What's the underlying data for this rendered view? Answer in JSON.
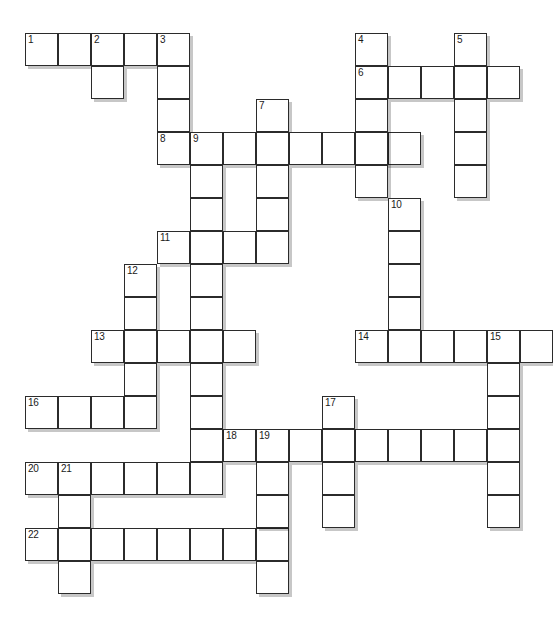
{
  "puzzle": {
    "type": "crossword-grid",
    "title": "Crossword Puzzle Grid",
    "geometry": {
      "origin_x": 25,
      "origin_y": 33,
      "cell_size": 33,
      "columns": 16,
      "rows": 17,
      "cell_border_color": "#2b2b2b",
      "cell_fill_color": "#ffffff",
      "shadow_color": "rgba(0,0,0,0.22)",
      "number_color": "#1a1a1a",
      "page_background": "#ffffff"
    },
    "numbered_clue_labels": [
      "1",
      "2",
      "3",
      "4",
      "5",
      "6",
      "7",
      "8",
      "9",
      "10",
      "11",
      "12",
      "13",
      "14",
      "15",
      "16",
      "17",
      "18",
      "19",
      "20",
      "21",
      "22"
    ],
    "cells": [
      {
        "c": 0,
        "r": 0,
        "n": "1"
      },
      {
        "c": 1,
        "r": 0,
        "n": ""
      },
      {
        "c": 2,
        "r": 0,
        "n": "2"
      },
      {
        "c": 3,
        "r": 0,
        "n": ""
      },
      {
        "c": 4,
        "r": 0,
        "n": "3"
      },
      {
        "c": 2,
        "r": 1,
        "n": ""
      },
      {
        "c": 4,
        "r": 1,
        "n": ""
      },
      {
        "c": 4,
        "r": 2,
        "n": ""
      },
      {
        "c": 7,
        "r": 2,
        "n": "7"
      },
      {
        "c": 4,
        "r": 3,
        "n": "8"
      },
      {
        "c": 5,
        "r": 3,
        "n": "9"
      },
      {
        "c": 6,
        "r": 3,
        "n": ""
      },
      {
        "c": 7,
        "r": 3,
        "n": ""
      },
      {
        "c": 8,
        "r": 3,
        "n": ""
      },
      {
        "c": 9,
        "r": 3,
        "n": ""
      },
      {
        "c": 10,
        "r": 3,
        "n": ""
      },
      {
        "c": 11,
        "r": 3,
        "n": ""
      },
      {
        "c": 5,
        "r": 4,
        "n": ""
      },
      {
        "c": 7,
        "r": 4,
        "n": ""
      },
      {
        "c": 5,
        "r": 5,
        "n": ""
      },
      {
        "c": 7,
        "r": 5,
        "n": ""
      },
      {
        "c": 4,
        "r": 6,
        "n": "11"
      },
      {
        "c": 5,
        "r": 6,
        "n": ""
      },
      {
        "c": 6,
        "r": 6,
        "n": ""
      },
      {
        "c": 7,
        "r": 6,
        "n": ""
      },
      {
        "c": 3,
        "r": 7,
        "n": "12"
      },
      {
        "c": 5,
        "r": 7,
        "n": ""
      },
      {
        "c": 3,
        "r": 8,
        "n": ""
      },
      {
        "c": 5,
        "r": 8,
        "n": ""
      },
      {
        "c": 2,
        "r": 9,
        "n": "13"
      },
      {
        "c": 3,
        "r": 9,
        "n": ""
      },
      {
        "c": 4,
        "r": 9,
        "n": ""
      },
      {
        "c": 5,
        "r": 9,
        "n": ""
      },
      {
        "c": 6,
        "r": 9,
        "n": ""
      },
      {
        "c": 3,
        "r": 10,
        "n": ""
      },
      {
        "c": 5,
        "r": 10,
        "n": ""
      },
      {
        "c": 0,
        "r": 11,
        "n": "16"
      },
      {
        "c": 1,
        "r": 11,
        "n": ""
      },
      {
        "c": 2,
        "r": 11,
        "n": ""
      },
      {
        "c": 3,
        "r": 11,
        "n": ""
      },
      {
        "c": 5,
        "r": 11,
        "n": ""
      },
      {
        "c": 5,
        "r": 12,
        "n": ""
      },
      {
        "c": 0,
        "r": 13,
        "n": "20"
      },
      {
        "c": 1,
        "r": 13,
        "n": "21"
      },
      {
        "c": 2,
        "r": 13,
        "n": ""
      },
      {
        "c": 3,
        "r": 13,
        "n": ""
      },
      {
        "c": 4,
        "r": 13,
        "n": ""
      },
      {
        "c": 5,
        "r": 13,
        "n": ""
      },
      {
        "c": 1,
        "r": 14,
        "n": ""
      },
      {
        "c": 0,
        "r": 15,
        "n": "22"
      },
      {
        "c": 1,
        "r": 15,
        "n": ""
      },
      {
        "c": 2,
        "r": 15,
        "n": ""
      },
      {
        "c": 3,
        "r": 15,
        "n": ""
      },
      {
        "c": 4,
        "r": 15,
        "n": ""
      },
      {
        "c": 5,
        "r": 15,
        "n": ""
      },
      {
        "c": 6,
        "r": 15,
        "n": ""
      },
      {
        "c": 7,
        "r": 15,
        "n": ""
      },
      {
        "c": 1,
        "r": 16,
        "n": ""
      },
      {
        "c": 10,
        "r": 0,
        "n": "4"
      },
      {
        "c": 13,
        "r": 0,
        "n": "5"
      },
      {
        "c": 10,
        "r": 1,
        "n": "6"
      },
      {
        "c": 11,
        "r": 1,
        "n": ""
      },
      {
        "c": 12,
        "r": 1,
        "n": ""
      },
      {
        "c": 13,
        "r": 1,
        "n": ""
      },
      {
        "c": 14,
        "r": 1,
        "n": ""
      },
      {
        "c": 10,
        "r": 2,
        "n": ""
      },
      {
        "c": 13,
        "r": 2,
        "n": ""
      },
      {
        "c": 10,
        "r": 3,
        "n": ""
      },
      {
        "c": 13,
        "r": 3,
        "n": ""
      },
      {
        "c": 10,
        "r": 4,
        "n": ""
      },
      {
        "c": 13,
        "r": 4,
        "n": ""
      },
      {
        "c": 11,
        "r": 5,
        "n": "10"
      },
      {
        "c": 11,
        "r": 6,
        "n": ""
      },
      {
        "c": 11,
        "r": 7,
        "n": ""
      },
      {
        "c": 11,
        "r": 8,
        "n": ""
      },
      {
        "c": 10,
        "r": 9,
        "n": "14"
      },
      {
        "c": 11,
        "r": 9,
        "n": ""
      },
      {
        "c": 12,
        "r": 9,
        "n": ""
      },
      {
        "c": 13,
        "r": 9,
        "n": ""
      },
      {
        "c": 14,
        "r": 9,
        "n": "15"
      },
      {
        "c": 15,
        "r": 9,
        "n": ""
      },
      {
        "c": 14,
        "r": 10,
        "n": ""
      },
      {
        "c": 9,
        "r": 11,
        "n": "17"
      },
      {
        "c": 14,
        "r": 11,
        "n": ""
      },
      {
        "c": 6,
        "r": 12,
        "n": "18"
      },
      {
        "c": 7,
        "r": 12,
        "n": "19"
      },
      {
        "c": 8,
        "r": 12,
        "n": ""
      },
      {
        "c": 9,
        "r": 12,
        "n": ""
      },
      {
        "c": 10,
        "r": 12,
        "n": ""
      },
      {
        "c": 11,
        "r": 12,
        "n": ""
      },
      {
        "c": 12,
        "r": 12,
        "n": ""
      },
      {
        "c": 13,
        "r": 12,
        "n": ""
      },
      {
        "c": 14,
        "r": 12,
        "n": ""
      },
      {
        "c": 7,
        "r": 13,
        "n": ""
      },
      {
        "c": 9,
        "r": 13,
        "n": ""
      },
      {
        "c": 14,
        "r": 13,
        "n": ""
      },
      {
        "c": 7,
        "r": 14,
        "n": ""
      },
      {
        "c": 9,
        "r": 14,
        "n": ""
      },
      {
        "c": 14,
        "r": 14,
        "n": ""
      },
      {
        "c": 7,
        "r": 16,
        "n": ""
      }
    ]
  }
}
